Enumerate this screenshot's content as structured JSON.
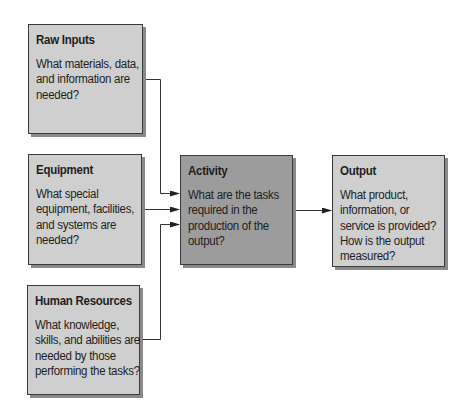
{
  "diagram": {
    "type": "flow",
    "nodes": [
      {
        "id": "raw-inputs",
        "title": "Raw Inputs",
        "body": "What materials, data, and information are needed?"
      },
      {
        "id": "equipment",
        "title": "Equipment",
        "body": "What special equipment, facilities, and systems are needed?"
      },
      {
        "id": "human-resources",
        "title": "Human Resources",
        "body": "What knowledge, skills, and abilities are needed by those performing the tasks?"
      },
      {
        "id": "activity",
        "title": "Activity",
        "body": "What are the tasks required in the production of the output?"
      },
      {
        "id": "output",
        "title": "Output",
        "body": "What product, information, or service is provided? How is the output measured?"
      }
    ],
    "edges": [
      {
        "from": "raw-inputs",
        "to": "activity"
      },
      {
        "from": "equipment",
        "to": "activity"
      },
      {
        "from": "human-resources",
        "to": "activity"
      },
      {
        "from": "activity",
        "to": "output"
      }
    ],
    "colors": {
      "input_box": "#cfcfcf",
      "activity_box": "#9c9c9c",
      "border": "#3a3a3a",
      "shadow": "#8a8a8a",
      "line": "#333333"
    }
  }
}
